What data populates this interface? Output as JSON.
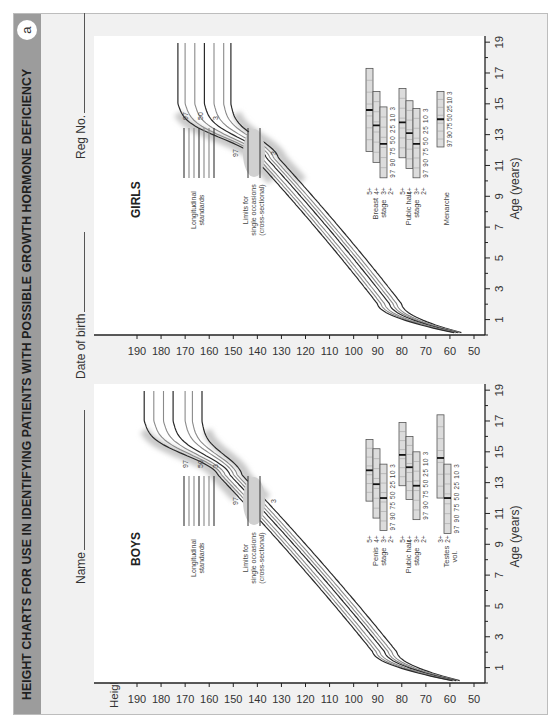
{
  "header": {
    "title": "HEIGHT CHARTS FOR USE IN IDENTIFYING PATIENTS WITH POSSIBLE GROWTH HORMONE DEFICIENCY",
    "panel_label": "a",
    "header_color": "#9c9c9c",
    "page_bg": "#f1f1f1"
  },
  "fields": {
    "name": "Name",
    "dob": "Date of birth",
    "reg": "Reg No."
  },
  "axes": {
    "ylabel": "Height (cm)",
    "xlabel": "Age (years)"
  },
  "legend": {
    "longitudinal": [
      "Longitudinal",
      "standards"
    ],
    "longitudinal_marks": [
      "97",
      "50",
      "3"
    ],
    "cross": [
      "Limits for",
      "single occasions",
      "(cross-sectional)"
    ],
    "cross_marks": [
      "97",
      "3"
    ]
  },
  "chart_data": [
    {
      "type": "line",
      "title": "BOYS",
      "xlabel": "Age (years)",
      "ylabel": "Height (cm)",
      "xlim": [
        0,
        19
      ],
      "ylim": [
        50,
        190
      ],
      "x_ticks": [
        1,
        3,
        5,
        7,
        9,
        11,
        13,
        15,
        17,
        19
      ],
      "y_ticks": [
        50,
        60,
        70,
        80,
        90,
        100,
        110,
        120,
        130,
        140,
        150,
        160,
        170,
        180,
        190
      ],
      "grid": false,
      "series": [
        {
          "name": "3rd",
          "final_height": 163,
          "birth": 52,
          "age2": 82
        },
        {
          "name": "10th",
          "final_height": 167,
          "birth": 52.5,
          "age2": 84
        },
        {
          "name": "25th",
          "final_height": 170,
          "birth": 53,
          "age2": 85.5
        },
        {
          "name": "50th",
          "final_height": 175,
          "birth": 53,
          "age2": 87
        },
        {
          "name": "75th",
          "final_height": 179,
          "birth": 53.5,
          "age2": 89
        },
        {
          "name": "90th",
          "final_height": 183,
          "birth": 54,
          "age2": 90.5
        },
        {
          "name": "97th",
          "final_height": 187,
          "birth": 54,
          "age2": 92
        }
      ],
      "puberty": [
        {
          "label": [
            "Penis",
            "stage"
          ],
          "stages": [
            {
              "stage": "5+",
              "start": 11.8,
              "end": 15.8,
              "median": 13.8
            },
            {
              "stage": "4+",
              "start": 10.7,
              "end": 15.2,
              "median": 12.9
            },
            {
              "stage": "3+",
              "start": 9.9,
              "end": 14.2,
              "median": 12.0
            },
            {
              "stage": "2+",
              "start": null,
              "end": null,
              "median": null
            }
          ],
          "centiles": "97 90 75 50 25 10 3"
        },
        {
          "label": [
            "Pubic hair",
            "stage"
          ],
          "stages": [
            {
              "stage": "5+",
              "start": 12.8,
              "end": 16.9,
              "median": 14.8
            },
            {
              "stage": "4+",
              "start": 11.9,
              "end": 16.0,
              "median": 14.0
            },
            {
              "stage": "3+",
              "start": 10.6,
              "end": 15.0,
              "median": 12.8
            },
            {
              "stage": "2+",
              "start": null,
              "end": null,
              "median": null
            }
          ],
          "centiles": "97 90 75 50 25 10 3"
        },
        {
          "label": [
            "Testes",
            "vol."
          ],
          "stages": [
            {
              "stage": "3+",
              "start": 12.0,
              "end": 17.4,
              "median": 14.6
            },
            {
              "stage": "2+",
              "start": 9.7,
              "end": 14.2,
              "median": 12.0
            }
          ],
          "centiles": "97 90 75 50 25 10 3"
        }
      ]
    },
    {
      "type": "line",
      "title": "GIRLS",
      "xlabel": "Age (years)",
      "ylabel": "Height (cm)",
      "xlim": [
        0,
        19
      ],
      "ylim": [
        50,
        190
      ],
      "x_ticks": [
        1,
        3,
        5,
        7,
        9,
        11,
        13,
        15,
        17,
        19
      ],
      "y_ticks": [
        50,
        60,
        70,
        80,
        90,
        100,
        110,
        120,
        130,
        140,
        150,
        160,
        170,
        180,
        190
      ],
      "grid": false,
      "series": [
        {
          "name": "3rd",
          "final_height": 151,
          "birth": 51.5,
          "age2": 80
        },
        {
          "name": "10th",
          "final_height": 154,
          "birth": 52,
          "age2": 82
        },
        {
          "name": "25th",
          "final_height": 158,
          "birth": 52,
          "age2": 83.5
        },
        {
          "name": "50th",
          "final_height": 162,
          "birth": 52.5,
          "age2": 85
        },
        {
          "name": "75th",
          "final_height": 166,
          "birth": 53,
          "age2": 87
        },
        {
          "name": "90th",
          "final_height": 170,
          "birth": 53,
          "age2": 88.5
        },
        {
          "name": "97th",
          "final_height": 173,
          "birth": 53.5,
          "age2": 90
        }
      ],
      "puberty": [
        {
          "label": [
            "Breast",
            "stage"
          ],
          "stages": [
            {
              "stage": "5+",
              "start": 11.9,
              "end": 17.3,
              "median": 14.6
            },
            {
              "stage": "4+",
              "start": 11.2,
              "end": 15.8,
              "median": 13.6
            },
            {
              "stage": "3+",
              "start": 10.2,
              "end": 14.8,
              "median": 12.4
            },
            {
              "stage": "2+",
              "start": null,
              "end": null,
              "median": null
            }
          ],
          "centiles": "97 90 75 50 25 10 3"
        },
        {
          "label": [
            "Pubic hair",
            "stage"
          ],
          "stages": [
            {
              "stage": "5+",
              "start": 11.5,
              "end": 16.0,
              "median": 13.8
            },
            {
              "stage": "4+",
              "start": 10.8,
              "end": 15.2,
              "median": 13.1
            },
            {
              "stage": "3+",
              "start": 10.2,
              "end": 14.7,
              "median": 12.4
            },
            {
              "stage": "2+",
              "start": null,
              "end": null,
              "median": null
            }
          ],
          "centiles": "97 90 75 50 25 10 3"
        },
        {
          "label": [
            "Menarche"
          ],
          "stages": [
            {
              "stage": "",
              "start": 12.2,
              "end": 15.8,
              "median": 14.0
            }
          ],
          "centiles": "97 90 75 50 25 10 3"
        }
      ]
    }
  ]
}
